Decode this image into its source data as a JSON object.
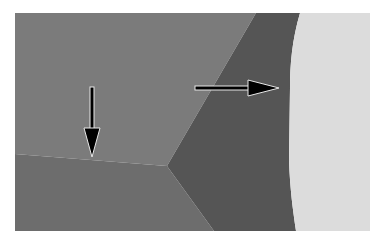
{
  "figure": {
    "type": "grayscale micrograph",
    "colors": {
      "background": "#ffffff",
      "grain_upper_left": "#7b7b7b",
      "grain_lower_left": "#6d6d6d",
      "grain_dark_wedge": "#555555",
      "grain_light_right": "#dcdcdc",
      "arrow_fill": "#000000",
      "arrow_outline": "#e8e8e8"
    },
    "annotations": [
      {
        "name": "down-arrow",
        "direction": "down",
        "points_to": "grain boundary between upper-left and lower-left grains"
      },
      {
        "name": "right-arrow",
        "direction": "right",
        "points_to": "boundary between dark wedge and light grain"
      }
    ]
  }
}
